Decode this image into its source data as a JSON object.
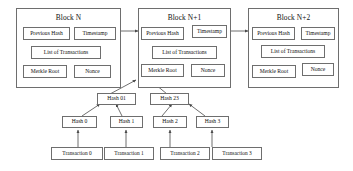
{
  "diagram": {
    "line_color": "#6e6e6e",
    "text_color": "#111111",
    "background": "#ffffff"
  },
  "blocks": [
    {
      "title": "Block N",
      "fields": {
        "previous_hash": "Previous Hash",
        "timestamp": "Timestamp",
        "list_of_transactions": "List of Transactions",
        "merkle_root": "Merkle Root",
        "nonce": "Nonce"
      }
    },
    {
      "title": "Block N+1",
      "fields": {
        "previous_hash": "Previous Hash",
        "timestamp": "Timestamp",
        "list_of_transactions": "List of Transactions",
        "merkle_root": "Merkle Root",
        "nonce": "Nonce"
      }
    },
    {
      "title": "Block N+2",
      "fields": {
        "previous_hash": "Previous Hash",
        "timestamp": "Timestamp",
        "list_of_transactions": "List of Transactions",
        "merkle_root": "Merkle Root",
        "nonce": "Nonce"
      }
    }
  ],
  "merkle_tree": {
    "intermediate_nodes": [
      {
        "label": "Hash 01"
      },
      {
        "label": "Hash 23"
      }
    ],
    "leaf_nodes": [
      {
        "label": "Hash 0"
      },
      {
        "label": "Hash 1"
      },
      {
        "label": "Hash 2"
      },
      {
        "label": "Hash 3"
      }
    ],
    "transactions": [
      {
        "label": "Transaction 0"
      },
      {
        "label": "Transaction 1"
      },
      {
        "label": "Transaction 2"
      },
      {
        "label": "Transaction 3"
      }
    ]
  }
}
